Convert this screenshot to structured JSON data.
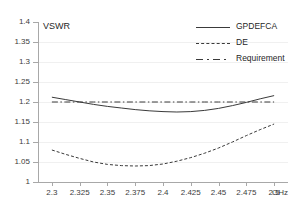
{
  "chart_data": {
    "type": "line",
    "title": "",
    "xlabel": "GHz",
    "ylabel": "VSWR",
    "xlim": [
      2.2875,
      2.5125
    ],
    "ylim": [
      1.0,
      1.4
    ],
    "grid": true,
    "legend_position": "top-right",
    "x_ticks": [
      "2.3",
      "2.325",
      "2.35",
      "2.375",
      "2.4",
      "2.425",
      "2.45",
      "2.475",
      "2.5"
    ],
    "x_tick_values": [
      2.3,
      2.325,
      2.35,
      2.375,
      2.4,
      2.425,
      2.45,
      2.475,
      2.5
    ],
    "y_ticks": [
      "1.4",
      "1.35",
      "1.3",
      "1.25",
      "1.2",
      "1.15",
      "1.1",
      "1.05",
      "1"
    ],
    "y_tick_values": [
      1.4,
      1.35,
      1.3,
      1.25,
      1.2,
      1.15,
      1.1,
      1.05,
      1.0
    ],
    "x": [
      2.3,
      2.3125,
      2.325,
      2.3375,
      2.35,
      2.3625,
      2.375,
      2.3875,
      2.4,
      2.4125,
      2.425,
      2.4375,
      2.45,
      2.4625,
      2.475,
      2.4875,
      2.5
    ],
    "series": [
      {
        "name": "GPDEFCA",
        "style": "solid",
        "color": "#3a3a3a",
        "values": [
          1.212,
          1.206,
          1.2,
          1.194,
          1.189,
          1.185,
          1.181,
          1.178,
          1.176,
          1.175,
          1.176,
          1.179,
          1.184,
          1.191,
          1.199,
          1.208,
          1.216
        ]
      },
      {
        "name": "DE",
        "style": "dashed",
        "color": "#3a3a3a",
        "values": [
          1.08,
          1.069,
          1.059,
          1.05,
          1.044,
          1.041,
          1.04,
          1.041,
          1.045,
          1.052,
          1.061,
          1.072,
          1.085,
          1.1,
          1.116,
          1.131,
          1.145
        ]
      },
      {
        "name": "Requirement",
        "style": "dashdot",
        "color": "#3a3a3a",
        "values": [
          1.2,
          1.2,
          1.2,
          1.2,
          1.2,
          1.2,
          1.2,
          1.2,
          1.2,
          1.2,
          1.2,
          1.2,
          1.2,
          1.2,
          1.2,
          1.2,
          1.2
        ]
      }
    ]
  },
  "legend": {
    "entries": [
      {
        "label": "GPDEFCA"
      },
      {
        "label": "DE"
      },
      {
        "label": "Requirement"
      }
    ]
  }
}
